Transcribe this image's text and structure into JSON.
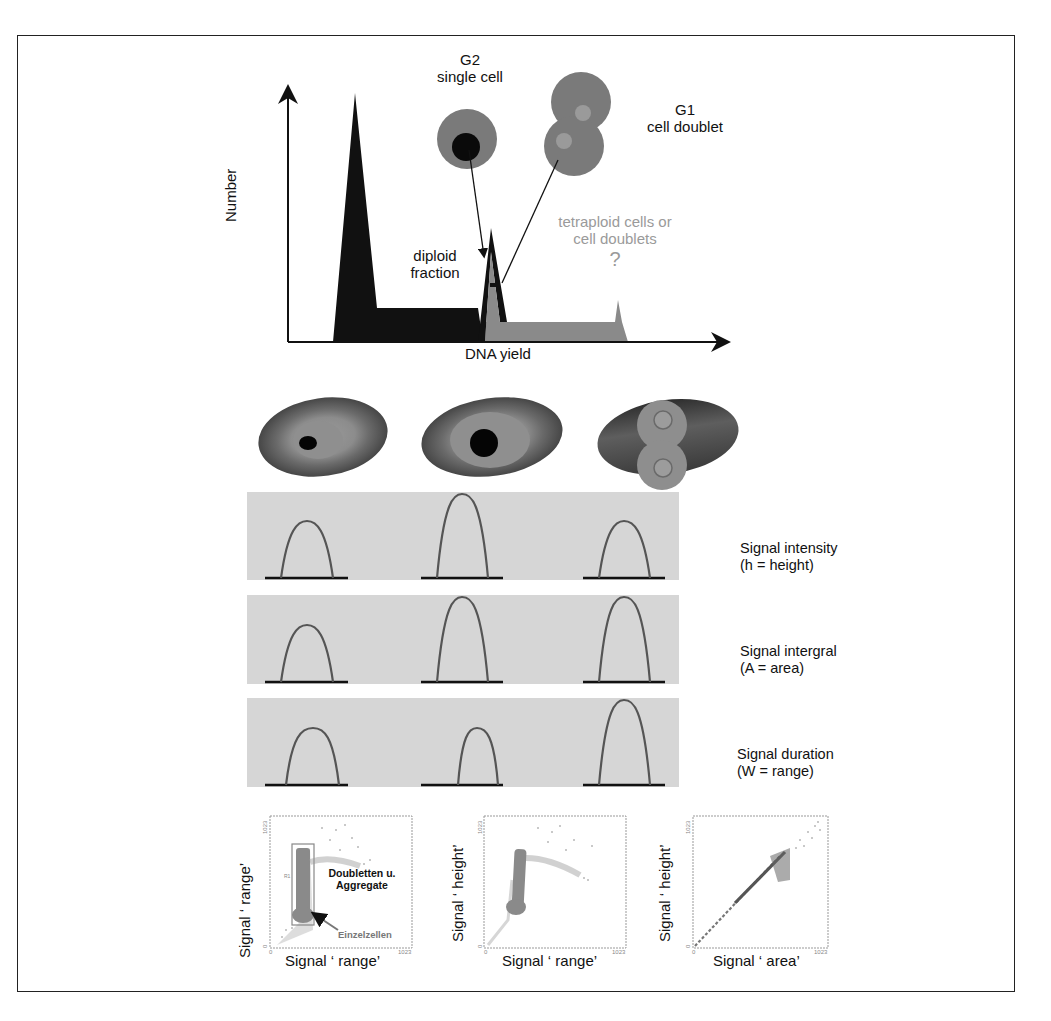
{
  "histogram": {
    "y_axis_label": "Number",
    "x_axis_label": "DNA yield",
    "g2_label_line1": "G2",
    "g2_label_line2": "single cell",
    "g1_label_line1": "G1",
    "g1_label_line2": "cell doublet",
    "diploid_line1": "diploid",
    "diploid_line2": "fraction",
    "tetraploid_line1": "tetraploid cells or",
    "tetraploid_line2": "cell doublets",
    "question": "?"
  },
  "signal_rows": [
    {
      "label_line1": "Signal intensity",
      "label_line2": "(h = height)"
    },
    {
      "label_line1": "Signal intergral",
      "label_line2": "(A = area)"
    },
    {
      "label_line1": "Signal duration",
      "label_line2": "(W = range)"
    }
  ],
  "scatter_plots": [
    {
      "ylabel": "Signal ‘ range’",
      "xlabel": "Signal ‘ range’",
      "tick_min": "0",
      "tick_max": "1023",
      "annotation_doublets_line1": "Doubletten u.",
      "annotation_doublets_line2": "Aggregate",
      "annotation_single": "Einzelzellen",
      "gate_label": "R1"
    },
    {
      "ylabel": "Signal ‘ height’",
      "xlabel": "Signal ‘ range’",
      "tick_min": "0",
      "tick_max": "1023"
    },
    {
      "ylabel": "Signal ‘ height’",
      "xlabel": "Signal ‘ area’",
      "tick_min": "0",
      "tick_max": "1023"
    }
  ],
  "colors": {
    "ink": "#111111",
    "gray_fill": "#8a8a8a",
    "cell_gray": "#7a7a7a",
    "panel_bg": "#d6d6d6",
    "peak_line": "#555555",
    "light_text": "#9a9a9a",
    "dots": "#777777"
  }
}
